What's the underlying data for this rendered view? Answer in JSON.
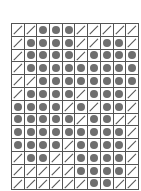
{
  "diagram": {
    "type": "grid-pattern",
    "columns": 10,
    "rows": 13,
    "legend": {
      "dot": "filled circle",
      "slash": "diagonal line"
    },
    "colors": {
      "dot": "#6f6f6f",
      "slash": "#555555",
      "grid": "#555555",
      "background": "#ffffff"
    },
    "grid": [
      "//ooo/////",
      "/oooo//oo/",
      "/oooo/oooo",
      "/ooooooooo",
      "//oooooooo",
      "/oooo/ooo/",
      "oooo/o/oo/",
      "ooooo/oo//",
      "ooooooooo/",
      "oooo/oooo/",
      "/oo//oooo/",
      "/////oooo/",
      "//////oo//"
    ]
  }
}
